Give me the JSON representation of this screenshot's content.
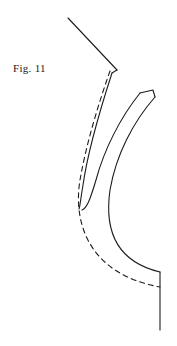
{
  "figure": {
    "label": "Fig. 11",
    "label_position": {
      "x": 13,
      "y": 62
    },
    "background_color": "#ffffff",
    "ink_color": "#1c1c1c",
    "canvas": {
      "width": 177,
      "height": 346
    },
    "stroke_width": 1.1,
    "dash_pattern": "5 4",
    "elements": [
      {
        "name": "upper-straight-line",
        "kind": "polyline",
        "style": "solid",
        "points": [
          [
            68,
            18
          ],
          [
            117,
            70
          ]
        ]
      },
      {
        "name": "upper-vertex-return-line",
        "kind": "polyline",
        "style": "solid",
        "points": [
          [
            117,
            70
          ],
          [
            112,
            73
          ]
        ]
      },
      {
        "name": "band-outer-edge",
        "kind": "path",
        "style": "solid",
        "d": "M 112 73 C 100 110 88 150 83 185 C 80 203 80 207 79 209"
      },
      {
        "name": "band-upper-cap",
        "kind": "polyline",
        "style": "solid",
        "points": [
          [
            140,
            93
          ],
          [
            153,
            90
          ],
          [
            155,
            97
          ]
        ]
      },
      {
        "name": "band-inner-edge",
        "kind": "path",
        "style": "solid",
        "d": "M 140 93 C 120 118 104 150 96 180 C 90 200 87 208 82 210"
      },
      {
        "name": "band-outer-lower-edge",
        "kind": "path",
        "style": "solid",
        "d": "M 155 97 C 133 122 116 155 110 190 C 104 232 118 262 160 272"
      },
      {
        "name": "dashed-reference-curve",
        "kind": "path",
        "style": "dashed",
        "d": "M 110 71 C 98 105 86 145 80 180 C 73 222 88 274 160 287"
      },
      {
        "name": "lower-vertical-line",
        "kind": "polyline",
        "style": "solid",
        "points": [
          [
            160,
            272
          ],
          [
            160,
            330
          ]
        ]
      }
    ]
  }
}
